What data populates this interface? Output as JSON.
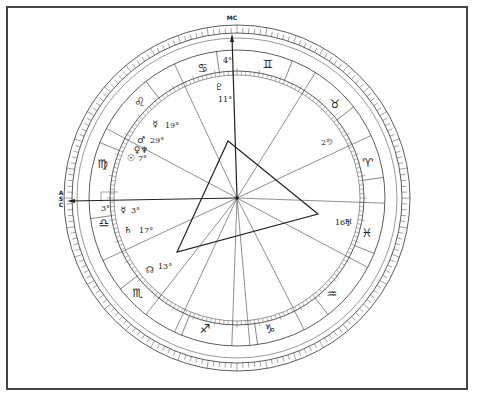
{
  "chart": {
    "axis_labels": {
      "mc": "MC",
      "asc": "ASC"
    },
    "center": {
      "x": 237,
      "y": 198
    },
    "colors": {
      "line": "#333333",
      "border": "#444444",
      "background": "#ffffff"
    },
    "signs": [
      {
        "name": "Aries",
        "glyph": "♈",
        "x": 368,
        "y": 167
      },
      {
        "name": "Taurus",
        "glyph": "♉",
        "x": 335,
        "y": 108
      },
      {
        "name": "Gemini",
        "glyph": "♊",
        "x": 268,
        "y": 68
      },
      {
        "name": "Cancer",
        "glyph": "♋",
        "x": 203,
        "y": 72
      },
      {
        "name": "Leo",
        "glyph": "♌",
        "x": 140,
        "y": 106
      },
      {
        "name": "Virgo",
        "glyph": "♍",
        "x": 103,
        "y": 168
      },
      {
        "name": "Libra",
        "glyph": "♎",
        "x": 104,
        "y": 227
      },
      {
        "name": "Scorpio",
        "glyph": "♏",
        "x": 138,
        "y": 297
      },
      {
        "name": "Sagittarius",
        "glyph": "♐",
        "x": 205,
        "y": 333
      },
      {
        "name": "Capricorn",
        "glyph": "♑",
        "x": 270,
        "y": 333
      },
      {
        "name": "Aquarius",
        "glyph": "♒",
        "x": 332,
        "y": 298
      },
      {
        "name": "Pisces",
        "glyph": "♓",
        "x": 367,
        "y": 237
      }
    ],
    "planets": [
      {
        "name": "Pluto",
        "glyph": "♇",
        "degree": "11°",
        "gx": 219,
        "gy": 90,
        "dx": 218,
        "dy": 102
      },
      {
        "name": "Mercury-Leo",
        "glyph": "☿",
        "degree": "19°",
        "gx": 155,
        "gy": 127,
        "dx": 165,
        "dy": 128
      },
      {
        "name": "Mars",
        "glyph": "♂",
        "degree": "29°",
        "gx": 141,
        "gy": 143,
        "dx": 150,
        "dy": 143
      },
      {
        "name": "Venus",
        "glyph": "♀",
        "degree": "",
        "gx": 137,
        "gy": 153,
        "dx": 0,
        "dy": 0
      },
      {
        "name": "Neptune",
        "glyph": "♆",
        "degree": "",
        "gx": 144,
        "gy": 153,
        "dx": 0,
        "dy": 0
      },
      {
        "name": "Sun",
        "glyph": "☉",
        "degree": "7°",
        "gx": 131,
        "gy": 161,
        "dx": 138,
        "dy": 161
      },
      {
        "name": "Mercury-Libra",
        "glyph": "☿",
        "degree": "3°",
        "gx": 123,
        "gy": 213,
        "dx": 131,
        "dy": 213
      },
      {
        "name": "Saturn",
        "glyph": "♄",
        "degree": "17°",
        "gx": 128,
        "gy": 233,
        "dx": 139,
        "dy": 233
      },
      {
        "name": "North Node",
        "glyph": "☊",
        "degree": "13°",
        "gx": 150,
        "gy": 273,
        "dx": 158,
        "dy": 269
      },
      {
        "name": "Moon",
        "glyph": "☽",
        "degree": "2°",
        "gx": 329,
        "gy": 145,
        "dx": 321,
        "dy": 145
      },
      {
        "name": "Uranus",
        "glyph": "♅",
        "degree": "16°",
        "gx": 348,
        "gy": 226,
        "dx": 335,
        "dy": 225
      }
    ],
    "cusp_degrees": [
      {
        "label": "4°",
        "x": 223,
        "y": 63
      },
      {
        "label": "3°",
        "x": 101,
        "y": 211
      }
    ],
    "aspect_triangle": [
      [
        228,
        141
      ],
      [
        318,
        214
      ],
      [
        177,
        252
      ]
    ]
  }
}
